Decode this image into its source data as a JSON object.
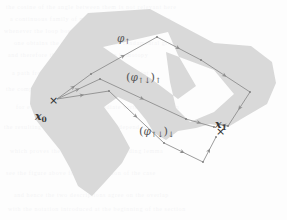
{
  "figure": {
    "caption_none": "",
    "background_color": "#fdfdfd",
    "region_fill": "#d9d9d9",
    "path_stroke": "#8a8a8a",
    "label_color": "#3a3a3a"
  },
  "endpoints": {
    "start": {
      "name": "x0",
      "base": "x",
      "sub": "0",
      "marker": "×"
    },
    "end": {
      "name": "x1",
      "base": "x",
      "sub": "1",
      "marker": "×"
    }
  },
  "path_labels": {
    "upper": {
      "text": "φ↑",
      "phi": "φ",
      "arrow": "↑"
    },
    "middle": {
      "text": "(φ↑↓)↑",
      "open": "(",
      "phi": "φ",
      "inner": "↑↓",
      "close": ")",
      "outer": "↑"
    },
    "lower": {
      "text": "(φ↑↓)↓",
      "open": "(",
      "phi": "φ",
      "inner": "↑↓",
      "close": ")",
      "outer": "↓"
    }
  },
  "chart_data": {
    "type": "diagram",
    "title": "",
    "region_polygon": [
      [
        88,
        13
      ],
      [
        150,
        9
      ],
      [
        182,
        26
      ],
      [
        214,
        43
      ],
      [
        251,
        46
      ],
      [
        272,
        62
      ],
      [
        276,
        83
      ],
      [
        267,
        104
      ],
      [
        243,
        118
      ],
      [
        228,
        127
      ],
      [
        210,
        124
      ],
      [
        196,
        128
      ],
      [
        178,
        131
      ],
      [
        166,
        140
      ],
      [
        154,
        133
      ],
      [
        146,
        120
      ],
      [
        133,
        104
      ],
      [
        118,
        97
      ],
      [
        104,
        107
      ],
      [
        118,
        126
      ],
      [
        130,
        148
      ],
      [
        122,
        163
      ],
      [
        105,
        182
      ],
      [
        92,
        196
      ],
      [
        78,
        186
      ],
      [
        70,
        168
      ],
      [
        60,
        150
      ],
      [
        47,
        134
      ],
      [
        36,
        120
      ],
      [
        30,
        104
      ],
      [
        31,
        88
      ],
      [
        40,
        72
      ],
      [
        55,
        52
      ],
      [
        70,
        31
      ]
    ],
    "region_holes": [
      [
        [
          103,
          47
        ],
        [
          168,
          32
        ],
        [
          178,
          55
        ],
        [
          196,
          86
        ],
        [
          178,
          99
        ],
        [
          150,
          78
        ],
        [
          126,
          63
        ]
      ],
      [
        [
          166,
          52
        ],
        [
          214,
          70
        ],
        [
          234,
          94
        ],
        [
          214,
          112
        ],
        [
          190,
          122
        ],
        [
          176,
          108
        ],
        [
          170,
          82
        ]
      ]
    ],
    "paths": [
      {
        "id": "upper",
        "label": "φ↑",
        "points": [
          [
            57,
            99
          ],
          [
            91,
            74
          ],
          [
            157,
            37
          ],
          [
            201,
            60
          ],
          [
            250,
            92
          ],
          [
            228,
            126
          ],
          [
            218,
            124
          ]
        ],
        "arrowheads": [
          [
            91,
            74
          ],
          [
            157,
            37
          ],
          [
            201,
            60
          ],
          [
            250,
            92
          ],
          [
            218,
            124
          ]
        ]
      },
      {
        "id": "middle",
        "label": "(φ↑↓)↑",
        "points": [
          [
            57,
            99
          ],
          [
            100,
            79
          ],
          [
            186,
            119
          ],
          [
            214,
            127
          ]
        ],
        "arrowheads": [
          [
            100,
            79
          ],
          [
            186,
            119
          ],
          [
            214,
            127
          ]
        ]
      },
      {
        "id": "lower",
        "label": "(φ↑↓)↓",
        "points": [
          [
            57,
            99
          ],
          [
            109,
            91
          ],
          [
            164,
            143
          ],
          [
            203,
            162
          ],
          [
            216,
            137
          ]
        ],
        "arrowheads": [
          [
            109,
            91
          ],
          [
            164,
            143
          ],
          [
            203,
            162
          ],
          [
            216,
            137
          ]
        ]
      }
    ],
    "label_positions": {
      "upper": [
        117,
        33
      ],
      "middle": [
        126,
        72
      ],
      "lower": [
        139,
        126
      ],
      "x0": [
        35,
        99
      ],
      "x1": [
        215,
        115
      ]
    },
    "axis_shown": false,
    "grid": false,
    "legend": "none"
  },
  "scan_bleed": {
    "visible": true,
    "rows": [
      {
        "top": 4,
        "left": 6,
        "text": "the cosine of the angle between them is not relevant here"
      },
      {
        "top": 16,
        "left": 10,
        "text": "a continuous family of maps connecting the two paths"
      },
      {
        "top": 28,
        "left": 4,
        "text": "whenever the loop bounds a disc in the given region"
      },
      {
        "top": 40,
        "left": 14,
        "text": "one obtains the same element of the fundamental group"
      },
      {
        "top": 52,
        "left": 8,
        "text": "and therefore the classes coincide in homotopy"
      },
      {
        "top": 70,
        "left": 12,
        "text": "a path from the base point to the second point"
      },
      {
        "top": 86,
        "left": 6,
        "text": "the composition of two such paths again is a path"
      },
      {
        "top": 104,
        "left": 16,
        "text": "for every choice of an intermediate vertex of the chain"
      },
      {
        "top": 124,
        "left": 4,
        "text": "the resulting homotopy class does not depend on it"
      },
      {
        "top": 148,
        "left": 10,
        "text": "which proves the statement of the preceding lemma"
      },
      {
        "top": 170,
        "left": 6,
        "text": "see the figure above for an illustration of the case"
      },
      {
        "top": 192,
        "left": 14,
        "text": "and hence the two descriptions agree on the overlap"
      },
      {
        "top": 206,
        "left": 8,
        "text": "with the notation introduced at the beginning of the section"
      }
    ]
  }
}
